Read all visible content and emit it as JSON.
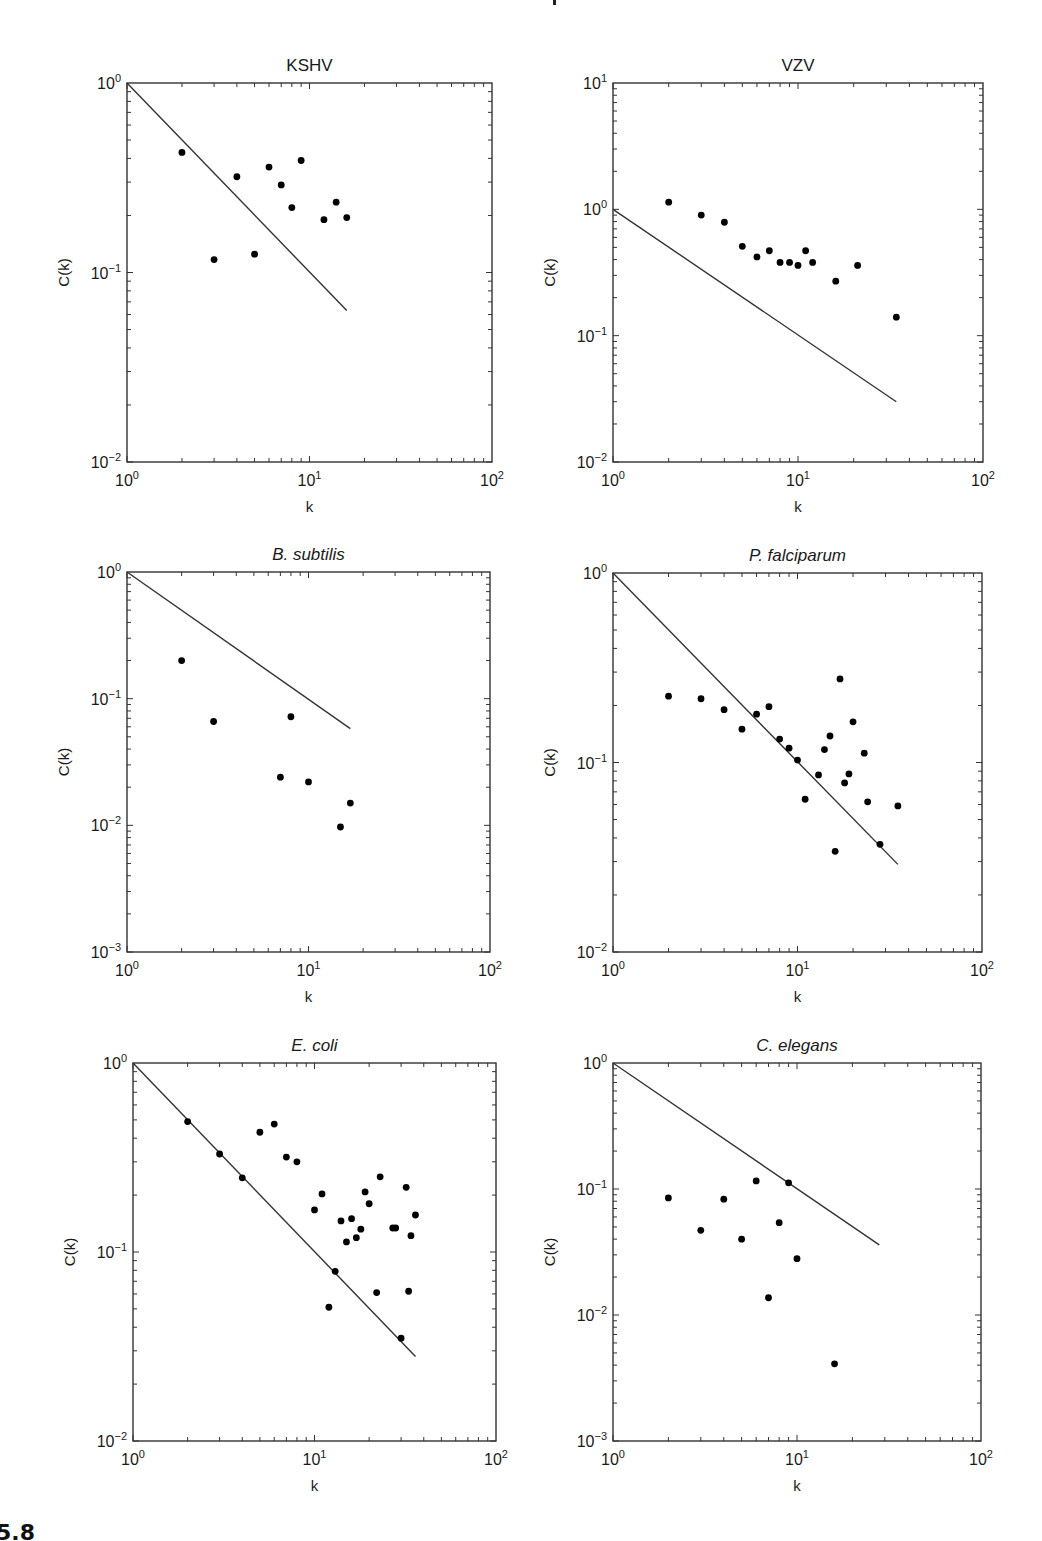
{
  "figure": {
    "label_fragment": "5.8",
    "colors": {
      "line": "#333333",
      "marker": "#000000",
      "axis": "#333333",
      "background": "#ffffff"
    }
  },
  "chart_data": [
    {
      "type": "scatter",
      "title": "KSHV",
      "title_italic": false,
      "xlabel": "k",
      "ylabel": "C(k)",
      "xscale": "log",
      "yscale": "log",
      "xlim": [
        1,
        100
      ],
      "ylim": [
        0.01,
        1
      ],
      "xticks": [
        "10^0",
        "10^1",
        "10^2"
      ],
      "yticks": [
        "10^-2",
        "10^-1",
        "10^0"
      ],
      "box": {
        "left": 127,
        "top": 83,
        "right": 492,
        "bottom": 462
      },
      "points": {
        "k": [
          2,
          3,
          4,
          5,
          6,
          7,
          8,
          9,
          12,
          14,
          16
        ],
        "C": [
          0.43,
          0.117,
          0.32,
          0.125,
          0.36,
          0.29,
          0.22,
          0.39,
          0.19,
          0.235,
          0.195
        ]
      },
      "fit_line": {
        "k": [
          1,
          16
        ],
        "C": [
          1,
          0.063
        ],
        "slope": -1
      }
    },
    {
      "type": "scatter",
      "title": "VZV",
      "title_italic": false,
      "xlabel": "k",
      "ylabel": "C(k)",
      "xscale": "log",
      "yscale": "log",
      "xlim": [
        1,
        100
      ],
      "ylim": [
        0.01,
        10
      ],
      "xticks": [
        "10^0",
        "10^1",
        "10^2"
      ],
      "yticks": [
        "10^-2",
        "10^-1",
        "10^0",
        "10^1"
      ],
      "box": {
        "left": 613,
        "top": 83,
        "right": 983,
        "bottom": 462
      },
      "points": {
        "k": [
          2,
          3,
          4,
          5,
          6,
          7,
          8,
          9,
          10,
          11,
          12,
          16,
          21,
          34
        ],
        "C": [
          1.14,
          0.9,
          0.79,
          0.51,
          0.42,
          0.47,
          0.38,
          0.38,
          0.36,
          0.47,
          0.38,
          0.27,
          0.36,
          0.14
        ]
      },
      "fit_line": {
        "k": [
          1,
          34
        ],
        "C": [
          1,
          0.03
        ],
        "slope": -1
      }
    },
    {
      "type": "scatter",
      "title": "B. subtilis",
      "title_italic": true,
      "xlabel": "k",
      "ylabel": "C(k)",
      "xscale": "log",
      "yscale": "log",
      "xlim": [
        1,
        100
      ],
      "ylim": [
        0.001,
        1
      ],
      "xticks": [
        "10^0",
        "10^1",
        "10^2"
      ],
      "yticks": [
        "10^-3",
        "10^-2",
        "10^-1",
        "10^0"
      ],
      "box": {
        "left": 127,
        "top": 572,
        "right": 490,
        "bottom": 952
      },
      "points": {
        "k": [
          2,
          3,
          7,
          8,
          10,
          15,
          17
        ],
        "C": [
          0.2,
          0.066,
          0.024,
          0.072,
          0.022,
          0.0097,
          0.015
        ]
      },
      "fit_line": {
        "k": [
          1,
          17
        ],
        "C": [
          1,
          0.058
        ],
        "slope": -1
      }
    },
    {
      "type": "scatter",
      "title": "P. falciparum",
      "title_italic": true,
      "xlabel": "k",
      "ylabel": "C(k)",
      "xscale": "log",
      "yscale": "log",
      "xlim": [
        1,
        100
      ],
      "ylim": [
        0.01,
        1
      ],
      "xticks": [
        "10^0",
        "10^1",
        "10^2"
      ],
      "yticks": [
        "10^-2",
        "10^-1",
        "10^0"
      ],
      "box": {
        "left": 613,
        "top": 573,
        "right": 982,
        "bottom": 952
      },
      "points": {
        "k": [
          2,
          3,
          4,
          5,
          6,
          7,
          8,
          9,
          10,
          11,
          13,
          14,
          15,
          16,
          17,
          18,
          19,
          20,
          23,
          24,
          28,
          35
        ],
        "C": [
          0.224,
          0.217,
          0.19,
          0.15,
          0.18,
          0.197,
          0.133,
          0.119,
          0.103,
          0.064,
          0.086,
          0.117,
          0.138,
          0.034,
          0.276,
          0.078,
          0.087,
          0.164,
          0.112,
          0.062,
          0.037,
          0.059
        ]
      },
      "fit_line": {
        "k": [
          1,
          35
        ],
        "C": [
          1,
          0.029
        ],
        "slope": -1
      }
    },
    {
      "type": "scatter",
      "title": "E. coli",
      "title_italic": true,
      "xlabel": "k",
      "ylabel": "C(k)",
      "xscale": "log",
      "yscale": "log",
      "xlim": [
        1,
        100
      ],
      "ylim": [
        0.01,
        1
      ],
      "xticks": [
        "10^0",
        "10^1",
        "10^2"
      ],
      "yticks": [
        "10^-2",
        "10^-1",
        "10^0"
      ],
      "box": {
        "left": 133,
        "top": 1063,
        "right": 496,
        "bottom": 1441
      },
      "points": {
        "k": [
          2,
          3,
          4,
          5,
          6,
          7,
          8,
          10,
          11,
          12,
          13,
          14,
          15,
          16,
          17,
          18,
          19,
          20,
          22,
          23,
          27,
          28,
          30,
          32,
          33,
          34,
          36
        ],
        "C": [
          0.49,
          0.33,
          0.247,
          0.43,
          0.475,
          0.318,
          0.3,
          0.167,
          0.203,
          0.051,
          0.079,
          0.146,
          0.113,
          0.15,
          0.119,
          0.132,
          0.208,
          0.18,
          0.061,
          0.25,
          0.134,
          0.134,
          0.035,
          0.22,
          0.062,
          0.122,
          0.157
        ]
      },
      "fit_line": {
        "k": [
          1,
          36
        ],
        "C": [
          1,
          0.028
        ],
        "slope": -1
      }
    },
    {
      "type": "scatter",
      "title": "C. elegans",
      "title_italic": true,
      "xlabel": "k",
      "ylabel": "C(k)",
      "xscale": "log",
      "yscale": "log",
      "xlim": [
        1,
        100
      ],
      "ylim": [
        0.001,
        1
      ],
      "xticks": [
        "10^0",
        "10^1",
        "10^2"
      ],
      "yticks": [
        "10^-3",
        "10^-2",
        "10^-1",
        "10^0"
      ],
      "box": {
        "left": 613,
        "top": 1063,
        "right": 981,
        "bottom": 1441
      },
      "points": {
        "k": [
          2,
          3,
          4,
          5,
          6,
          7,
          8,
          9,
          10,
          16
        ],
        "C": [
          0.085,
          0.047,
          0.083,
          0.04,
          0.116,
          0.0137,
          0.054,
          0.112,
          0.028,
          0.0041
        ]
      },
      "fit_line": {
        "k": [
          1,
          28
        ],
        "C": [
          1,
          0.036
        ],
        "slope": -1
      }
    }
  ]
}
